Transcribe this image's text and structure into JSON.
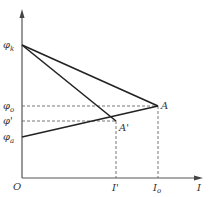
{
  "diagram": {
    "axes": {
      "y_axis_label": "",
      "x_axis_label": "I",
      "origin_label": "O"
    },
    "y_labels": [
      {
        "id": "phi_k",
        "base": "φ",
        "sub": "k",
        "y": 45
      },
      {
        "id": "phi_o",
        "base": "φ",
        "sub": "o",
        "y": 106
      },
      {
        "id": "phi_prime",
        "base": "φ'",
        "sub": "",
        "y": 121
      },
      {
        "id": "phi_a",
        "base": "φ",
        "sub": "a",
        "y": 137
      }
    ],
    "x_labels": [
      {
        "id": "I_prime",
        "base": "I'",
        "sub": "",
        "x": 116
      },
      {
        "id": "I_o",
        "base": "I",
        "sub": "o",
        "x": 158
      }
    ],
    "points": [
      {
        "id": "A",
        "label": "A",
        "x": 158,
        "y": 106
      },
      {
        "id": "A_prime",
        "label": "A'",
        "x": 116,
        "y": 121
      }
    ],
    "solid_lines": [
      {
        "from": "phi_k",
        "to": "A"
      },
      {
        "from": "phi_k",
        "to": "A_prime"
      },
      {
        "from": "phi_a",
        "to": "A"
      }
    ],
    "dashed_lines": [
      {
        "from": "phi_o",
        "to": "A"
      },
      {
        "from": "phi_prime",
        "to": "A_prime"
      },
      {
        "from": "A",
        "to": "I_o"
      },
      {
        "from": "A_prime",
        "to": "I_prime"
      }
    ],
    "colors": {
      "line": "#222222",
      "axis": "#555555",
      "dash": "#666666"
    }
  }
}
